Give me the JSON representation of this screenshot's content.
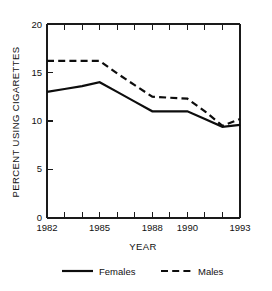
{
  "chart_data": {
    "type": "line",
    "title": "",
    "xlabel": "YEAR",
    "ylabel": "PERCENT USING CIGARETTES",
    "x": [
      1982,
      1983,
      1984,
      1985,
      1986,
      1987,
      1988,
      1989,
      1990,
      1991,
      1992,
      1993
    ],
    "xlim": [
      1982,
      1993
    ],
    "ylim": [
      0,
      20
    ],
    "xtick_values": [
      1982,
      1983,
      1984,
      1985,
      1986,
      1987,
      1988,
      1989,
      1990,
      1991,
      1992,
      1993
    ],
    "xtick_labels": [
      "1982",
      "",
      "",
      "1985",
      "",
      "",
      "1988",
      "",
      "1990",
      "",
      "",
      "1993"
    ],
    "ytick_values": [
      0,
      5,
      10,
      15,
      20
    ],
    "ytick_labels": [
      "0",
      "5",
      "10",
      "15",
      "20"
    ],
    "grid": false,
    "legend_position": "below",
    "series": [
      {
        "name": "Females",
        "style": "solid",
        "color": "#0d0d0d",
        "values": [
          13.0,
          13.3,
          13.6,
          14.0,
          13.0,
          12.0,
          11.0,
          11.0,
          11.0,
          10.2,
          9.4,
          9.6
        ]
      },
      {
        "name": "Males",
        "style": "dashed",
        "color": "#0d0d0d",
        "values": [
          16.2,
          16.2,
          16.2,
          16.2,
          14.9,
          13.7,
          12.5,
          12.4,
          12.3,
          11.0,
          9.5,
          10.2
        ]
      }
    ]
  },
  "legend": {
    "items": [
      {
        "label": "Females",
        "style": "solid"
      },
      {
        "label": "Males",
        "style": "dashed"
      }
    ]
  }
}
